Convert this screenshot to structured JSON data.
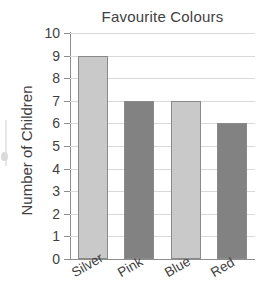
{
  "chart_data": {
    "type": "bar",
    "title": "Favourite Colours",
    "xlabel": "",
    "ylabel": "Number of Children",
    "categories": [
      "Silver",
      "Pink",
      "Blue",
      "Red"
    ],
    "values": [
      9,
      7,
      7,
      6
    ],
    "bar_colors": [
      "#c9c9c9",
      "#828282",
      "#c9c9c9",
      "#828282"
    ],
    "bar_edge_color": "#8a8a8a",
    "ylim": [
      0,
      10
    ],
    "ytick_labels": [
      "10",
      "9",
      "8",
      "7",
      "6",
      "5",
      "4",
      "3",
      "2",
      "1",
      "0"
    ],
    "ytick_values": [
      10,
      9,
      8,
      7,
      6,
      5,
      4,
      3,
      2,
      1,
      0
    ],
    "grid": true,
    "grid_color": "#d9d9d9",
    "axis_color": "#8d8d8d",
    "legend": false,
    "xtick_rotation": -30,
    "background": "#ffffff",
    "text_color": "#3f3f3f"
  }
}
